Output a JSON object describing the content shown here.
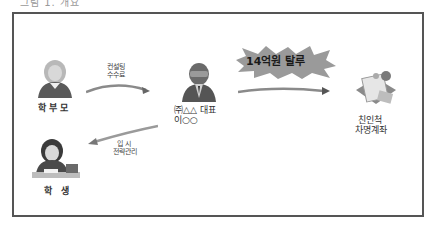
{
  "caption": "그림 1. 개요",
  "nodes": {
    "parents": {
      "label": "학부모",
      "icon": "parent-person-icon"
    },
    "student": {
      "label": "학 생",
      "icon": "student-person-icon"
    },
    "ceo": {
      "label_line1": "㈜△△ 대표",
      "label_line2": "이○○",
      "icon": "businessman-icon"
    },
    "accounts": {
      "label_line1": "친인척",
      "label_line2": "차명계좌",
      "icon": "bank-documents-icon"
    }
  },
  "edges": {
    "fee": {
      "label_line1": "컨설팅",
      "label_line2": "수수료"
    },
    "admission": {
      "label_line1": "입 시",
      "label_line2": "전략관리"
    },
    "evasion": {
      "label": "14억원 탈루"
    }
  },
  "colors": {
    "border": "#555555",
    "arrow": "#8a8a8a",
    "burst": "#9a9a9a",
    "burst_text": "#1a1a1a"
  }
}
